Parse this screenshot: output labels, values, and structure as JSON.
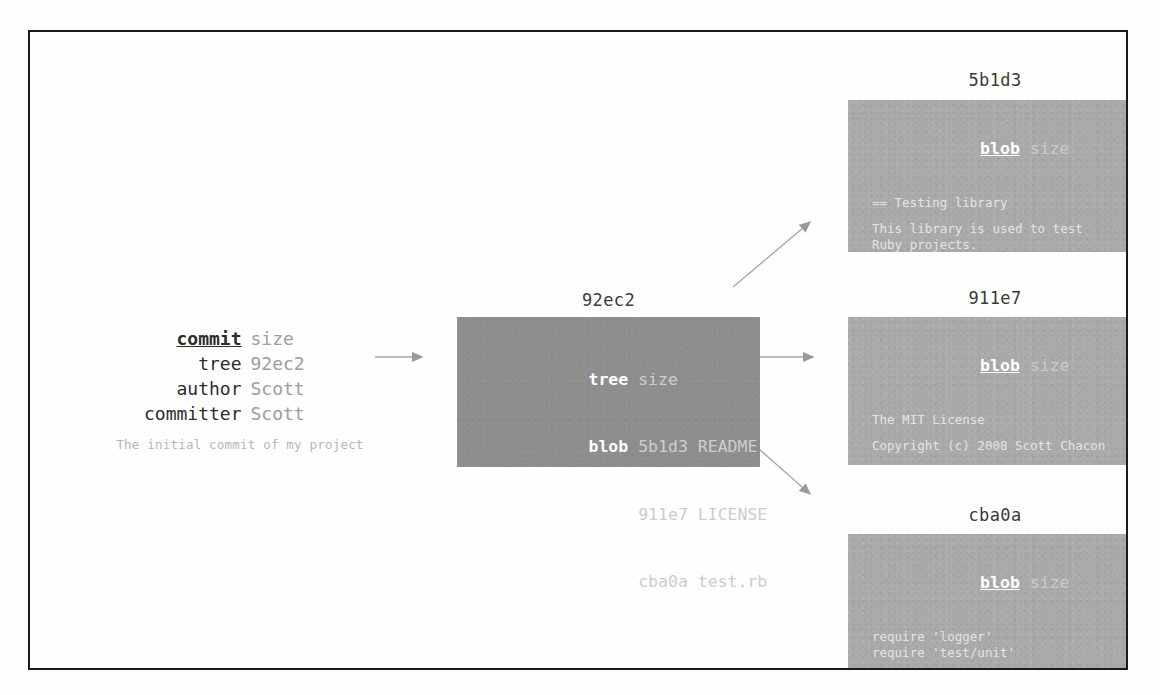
{
  "diagram": {
    "frame_color": "#1b1b1b",
    "tree_box_color": "#8e8e8e",
    "blob_box_color": "#aaaaaa",
    "arrow_color": "#9a9a9a"
  },
  "commit_object": {
    "hash": "98ca9",
    "rows": [
      {
        "key": "commit",
        "value": "size"
      },
      {
        "key": "tree",
        "value": "92ec2"
      },
      {
        "key": "author",
        "value": "Scott"
      },
      {
        "key": "committer",
        "value": "Scott"
      }
    ],
    "message": "The initial commit of my project"
  },
  "tree_object": {
    "hash": "92ec2",
    "rows": [
      {
        "key": "tree",
        "value": "size"
      },
      {
        "key": "blob",
        "value": "5b1d3 README"
      },
      {
        "key": "blob",
        "value": "911e7 LICENSE"
      },
      {
        "key": "blob",
        "value": "cba0a test.rb"
      }
    ]
  },
  "blob_objects": [
    {
      "hash": "5b1d3",
      "type_label": "blob",
      "size_label": "size",
      "lines": [
        "== Testing library",
        "",
        "This library is used to test",
        "Ruby projects."
      ]
    },
    {
      "hash": "911e7",
      "type_label": "blob",
      "size_label": "size",
      "lines": [
        "The MIT License",
        "",
        "Copyright (c) 2008 Scott Chacon",
        "",
        "Permission is hereby granted,",
        "free of charge, to any person"
      ]
    },
    {
      "hash": "cba0a",
      "type_label": "blob",
      "size_label": "size",
      "lines": [
        "require 'logger'",
        "require 'test/unit'",
        "",
        "class Test::Unit::TestCase"
      ]
    }
  ],
  "arrows": [
    {
      "name": "commit-to-tree",
      "from": "98ca9",
      "to": "92ec2"
    },
    {
      "name": "tree-to-blob-5b1d3",
      "from": "92ec2",
      "to": "5b1d3"
    },
    {
      "name": "tree-to-blob-911e7",
      "from": "92ec2",
      "to": "911e7"
    },
    {
      "name": "tree-to-blob-cba0a",
      "from": "92ec2",
      "to": "cba0a"
    }
  ]
}
